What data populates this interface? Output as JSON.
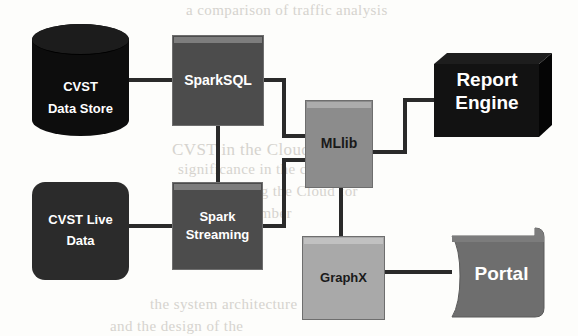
{
  "diagram": {
    "background_color": "#fdfdfb",
    "line_color": "#2a2a2a",
    "nodes": [
      {
        "id": "cvst-data-store",
        "label_lines": [
          "CVST",
          "Data Store"
        ],
        "shape": "cylinder",
        "fill": "#0d0d0d",
        "text_color": "#ffffff",
        "x": 32,
        "y": 24,
        "w": 97,
        "h": 112
      },
      {
        "id": "cvst-live-data",
        "label_lines": [
          "CVST Live",
          "Data"
        ],
        "shape": "rounded-rect",
        "fill": "#2b2b2b",
        "text_color": "#ffffff",
        "x": 32,
        "y": 182,
        "w": 97,
        "h": 98
      },
      {
        "id": "sparksql",
        "label_lines": [
          "SparkSQL"
        ],
        "shape": "rect",
        "fill": "#4c4c4c",
        "text_color": "#ffffff",
        "x": 172,
        "y": 35,
        "w": 92,
        "h": 91
      },
      {
        "id": "spark-streaming",
        "label_lines": [
          "Spark",
          "Streaming"
        ],
        "shape": "rect",
        "fill": "#4c4c4c",
        "text_color": "#ffffff",
        "x": 172,
        "y": 182,
        "w": 91,
        "h": 88
      },
      {
        "id": "mllib",
        "label_lines": [
          "MLlib"
        ],
        "shape": "rect",
        "fill": "#8c8c8c",
        "text_color": "#141414",
        "x": 305,
        "y": 100,
        "w": 68,
        "h": 88
      },
      {
        "id": "graphx",
        "label_lines": [
          "GraphX"
        ],
        "shape": "rect",
        "fill": "#a9a9a9",
        "text_color": "#141414",
        "x": 302,
        "y": 236,
        "w": 83,
        "h": 84
      },
      {
        "id": "report-engine",
        "label_lines": [
          "Report",
          "Engine"
        ],
        "shape": "cube-3d",
        "fill": "#121212",
        "text_color": "#ffffff",
        "x": 434,
        "y": 53,
        "w": 118,
        "h": 84
      },
      {
        "id": "portal",
        "label_lines": [
          "Portal"
        ],
        "shape": "tape",
        "fill": "#6e6e6e",
        "text_color": "#ffffff",
        "x": 443,
        "y": 226,
        "w": 105,
        "h": 96
      }
    ],
    "edges": [
      {
        "id": "edge-datastore-sparksql",
        "from": "cvst-data-store",
        "to": "sparksql"
      },
      {
        "id": "edge-livedata-streaming",
        "from": "cvst-live-data",
        "to": "spark-streaming"
      },
      {
        "id": "edge-sparksql-streaming",
        "from": "sparksql",
        "to": "spark-streaming"
      },
      {
        "id": "edge-sparksql-mllib",
        "from": "sparksql",
        "to": "mllib"
      },
      {
        "id": "edge-streaming-mllib",
        "from": "spark-streaming",
        "to": "mllib"
      },
      {
        "id": "edge-mllib-reportengine",
        "from": "mllib",
        "to": "report-engine"
      },
      {
        "id": "edge-mllib-graphx",
        "from": "mllib",
        "to": "graphx"
      },
      {
        "id": "edge-graphx-portal",
        "from": "graphx",
        "to": "portal"
      }
    ],
    "bleed_text": [
      {
        "text": "a comparison of traffic analysis",
        "x": 186,
        "y": 10,
        "size": 15
      },
      {
        "text": "CVST in the Cloud",
        "x": 172,
        "y": 148,
        "size": 17
      },
      {
        "text": "significance in the cloud to",
        "x": 178,
        "y": 168,
        "size": 14
      },
      {
        "text": "we are using the Cloud for",
        "x": 188,
        "y": 190,
        "size": 14
      },
      {
        "text": "with a number",
        "x": 200,
        "y": 212,
        "size": 14
      },
      {
        "text": "the system architecture",
        "x": 150,
        "y": 300,
        "size": 14
      },
      {
        "text": "and the design of the",
        "x": 110,
        "y": 325,
        "size": 14
      }
    ]
  }
}
